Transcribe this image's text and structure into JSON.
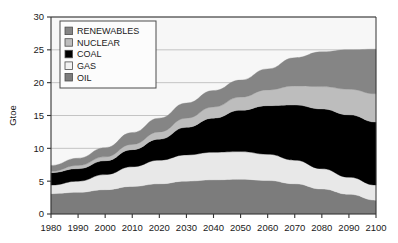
{
  "chart_data": {
    "type": "area",
    "title": "",
    "subtitle": "",
    "xlabel": "",
    "ylabel": "Gtoe",
    "xlim": [
      1980,
      2100
    ],
    "ylim": [
      0,
      30
    ],
    "ytick_step": 5,
    "xtick_step": 10,
    "grid": true,
    "grid_axis": "y",
    "stacked": true,
    "stack_order_bottom_to_top": [
      "OIL",
      "GAS",
      "COAL",
      "NUCLEAR",
      "RENEWABLES"
    ],
    "legend_position": "top-left-inside",
    "x": [
      1980,
      1990,
      2000,
      2010,
      2020,
      2030,
      2040,
      2050,
      2060,
      2070,
      2080,
      2090,
      2100
    ],
    "xtick_labels": [
      "1980",
      "1990",
      "2000",
      "2010",
      "2020",
      "2030",
      "2040",
      "2050",
      "2060",
      "2070",
      "2080",
      "2090",
      "2100"
    ],
    "ytick_labels": [
      "0",
      "5",
      "10",
      "15",
      "20",
      "25",
      "30"
    ],
    "series": [
      {
        "name": "OIL",
        "color": "#7c7c7c",
        "values": [
          3.1,
          3.3,
          3.7,
          4.2,
          4.6,
          5.0,
          5.2,
          5.3,
          5.1,
          4.6,
          3.8,
          3.0,
          2.1
        ]
      },
      {
        "name": "GAS",
        "color": "#e8e8e8",
        "values": [
          1.3,
          1.7,
          2.3,
          3.0,
          3.6,
          4.0,
          4.2,
          4.2,
          4.0,
          3.6,
          3.1,
          2.6,
          2.3
        ]
      },
      {
        "name": "COAL",
        "color": "#000000",
        "values": [
          1.9,
          1.9,
          2.1,
          2.6,
          3.2,
          4.2,
          5.2,
          6.3,
          7.4,
          8.4,
          9.1,
          9.5,
          9.6
        ]
      },
      {
        "name": "NUCLEAR",
        "color": "#bdbdbd",
        "values": [
          0.2,
          0.5,
          0.6,
          0.8,
          1.1,
          1.4,
          1.7,
          2.0,
          2.4,
          2.9,
          3.4,
          3.9,
          4.3
        ]
      },
      {
        "name": "RENEWABLES",
        "color": "#858585",
        "values": [
          0.9,
          1.1,
          1.4,
          1.8,
          2.1,
          2.3,
          2.5,
          2.6,
          3.2,
          4.3,
          5.3,
          6.0,
          6.8
        ]
      }
    ],
    "totals": [
      7.4,
      8.5,
      10.1,
      12.4,
      14.6,
      16.9,
      18.8,
      20.4,
      22.1,
      23.8,
      24.7,
      25.0,
      25.1
    ]
  },
  "legend": {
    "items": [
      {
        "label": "RENEWABLES",
        "swatch": "#858585"
      },
      {
        "label": "NUCLEAR",
        "swatch": "#bdbdbd"
      },
      {
        "label": "COAL",
        "swatch": "#000000"
      },
      {
        "label": "GAS",
        "swatch": "#f2f2f2"
      },
      {
        "label": "OIL",
        "swatch": "#7c7c7c"
      }
    ]
  },
  "colors": {
    "plot_background": "#f7f7f7",
    "page_background": "#ffffff",
    "axis": "#333333",
    "grid": "#b6b6b6",
    "legend_border": "#4d4d4d",
    "legend_background": "#fcfcfc",
    "text": "#1a1a1a"
  }
}
